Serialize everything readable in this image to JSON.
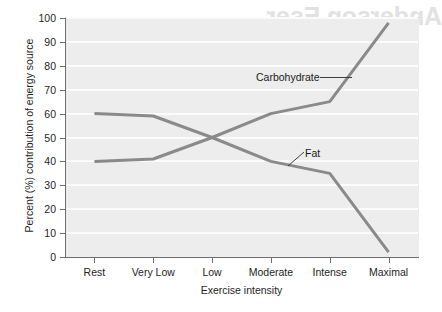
{
  "figure": {
    "watermark_text": "Anderson Eser",
    "line_color": "#8a8a8a",
    "plot_background": "#ededed",
    "gridline_color": "#fbfbfb",
    "axis_color": "#6e6e6e"
  },
  "chart_data": {
    "type": "line",
    "title": "",
    "xlabel": "Exercise intensity",
    "ylabel": "Percent (%) contribution of energy source",
    "categories": [
      "Rest",
      "Very Low",
      "Low",
      "Moderate",
      "Intense",
      "Maximal"
    ],
    "yticks": [
      0,
      10,
      20,
      30,
      40,
      50,
      60,
      70,
      80,
      90,
      100
    ],
    "ytick_labels": [
      "0",
      "10",
      "20",
      "30",
      "40",
      "50",
      "60",
      "70",
      "80",
      "90",
      "100"
    ],
    "ylim": [
      0,
      100
    ],
    "grid": true,
    "grid_axis": "y",
    "legend": "none",
    "annotations": [
      {
        "name": "carbohydrate",
        "label": "Carbohydrate",
        "target_category": "Intense"
      },
      {
        "name": "fat",
        "label": "Fat",
        "target_category": "Moderate"
      }
    ],
    "series": [
      {
        "name": "Carbohydrate",
        "values": [
          40,
          41,
          50,
          60,
          65,
          98
        ],
        "color": "#8a8a8a"
      },
      {
        "name": "Fat",
        "values": [
          60,
          59,
          50,
          40,
          35,
          2
        ],
        "color": "#8a8a8a"
      }
    ]
  }
}
